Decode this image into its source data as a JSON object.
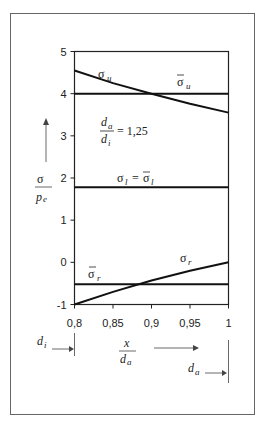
{
  "chart_data": {
    "type": "line",
    "title": "",
    "xlabel": "x / d_a",
    "ylabel": "σ / p_e",
    "xlim": [
      0.8,
      1.0
    ],
    "ylim": [
      -1,
      5
    ],
    "x_ticks": [
      "0,8",
      "0,85",
      "0,9",
      "0,95",
      "1"
    ],
    "x_tick_values": [
      0.8,
      0.85,
      0.9,
      0.95,
      1.0
    ],
    "y_ticks": [
      "-1",
      "0",
      "1",
      "2",
      "3",
      "4",
      "5"
    ],
    "y_tick_values": [
      -1,
      0,
      1,
      2,
      3,
      4,
      5
    ],
    "grid": false,
    "legend": "none (inline labels)",
    "series": [
      {
        "name": "σ_u",
        "x": [
          0.8,
          0.85,
          0.9,
          0.95,
          1.0
        ],
        "values": [
          4.55,
          4.25,
          4.0,
          3.76,
          3.55
        ]
      },
      {
        "name": "σ̄_u",
        "x": [
          0.8,
          1.0
        ],
        "values": [
          4.0,
          4.0
        ]
      },
      {
        "name": "σ_l = σ̄_l",
        "x": [
          0.8,
          1.0
        ],
        "values": [
          1.78,
          1.78
        ]
      },
      {
        "name": "σ_r",
        "x": [
          0.8,
          0.85,
          0.9,
          0.95,
          1.0
        ],
        "values": [
          -1.0,
          -0.7,
          -0.43,
          -0.2,
          0.0
        ]
      },
      {
        "name": "σ̄_r",
        "x": [
          0.8,
          1.0
        ],
        "values": [
          -0.52,
          -0.52
        ]
      }
    ],
    "annotations": [
      {
        "text": "d_a / d_i = 1,25"
      },
      {
        "text": "σ_u"
      },
      {
        "text": "σ̄_u"
      },
      {
        "text": "σ_l = σ̄_l"
      },
      {
        "text": "σ_r"
      },
      {
        "text": "σ̄_r"
      },
      {
        "text": "d_i →"
      },
      {
        "text": "d_a →"
      }
    ]
  },
  "labels": {
    "sigma": "σ",
    "pe_p": "p",
    "pe_e": "e",
    "x": "x",
    "da_d": "d",
    "da_a": "a",
    "di_d": "d",
    "di_i": "i",
    "ratio_eq": "= 1,25",
    "sigma_u_sub": "u",
    "sigma_l_sub": "l",
    "sigma_r_sub": "r",
    "equals": "="
  }
}
